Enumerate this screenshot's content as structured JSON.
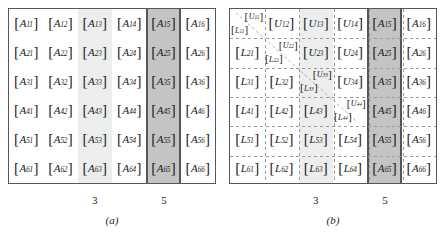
{
  "figure": {
    "rows": 6,
    "cols": 6,
    "colors": {
      "frame_border": "#55565a",
      "shade_light": "#eceded",
      "shade_dark": "#c3c4c4",
      "dash_line": "#9a9b9e",
      "text": "#1b1b1d",
      "background": "#ffffff"
    }
  },
  "panels": [
    {
      "id": "panel-a",
      "caption": "(a)",
      "column_labels": [
        {
          "text": "3",
          "column": 3
        },
        {
          "text": "5",
          "column": 5
        }
      ],
      "shaded_columns": [
        {
          "column": 3,
          "shade": "light"
        },
        {
          "column": 5,
          "shade": "dark"
        }
      ],
      "grid": [
        [
          {
            "kind": "single",
            "symbol": "A",
            "sub": "11"
          },
          {
            "kind": "single",
            "symbol": "A",
            "sub": "12"
          },
          {
            "kind": "single",
            "symbol": "A",
            "sub": "13"
          },
          {
            "kind": "single",
            "symbol": "A",
            "sub": "14"
          },
          {
            "kind": "single",
            "symbol": "A",
            "sub": "15"
          },
          {
            "kind": "single",
            "symbol": "A",
            "sub": "16"
          }
        ],
        [
          {
            "kind": "single",
            "symbol": "A",
            "sub": "21"
          },
          {
            "kind": "single",
            "symbol": "A",
            "sub": "22"
          },
          {
            "kind": "single",
            "symbol": "A",
            "sub": "23"
          },
          {
            "kind": "single",
            "symbol": "A",
            "sub": "24"
          },
          {
            "kind": "single",
            "symbol": "A",
            "sub": "25"
          },
          {
            "kind": "single",
            "symbol": "A",
            "sub": "26"
          }
        ],
        [
          {
            "kind": "single",
            "symbol": "A",
            "sub": "31"
          },
          {
            "kind": "single",
            "symbol": "A",
            "sub": "32"
          },
          {
            "kind": "single",
            "symbol": "A",
            "sub": "33"
          },
          {
            "kind": "single",
            "symbol": "A",
            "sub": "34"
          },
          {
            "kind": "single",
            "symbol": "A",
            "sub": "35"
          },
          {
            "kind": "single",
            "symbol": "A",
            "sub": "36"
          }
        ],
        [
          {
            "kind": "single",
            "symbol": "A",
            "sub": "41"
          },
          {
            "kind": "single",
            "symbol": "A",
            "sub": "42"
          },
          {
            "kind": "single",
            "symbol": "A",
            "sub": "43"
          },
          {
            "kind": "single",
            "symbol": "A",
            "sub": "44"
          },
          {
            "kind": "single",
            "symbol": "A",
            "sub": "45"
          },
          {
            "kind": "single",
            "symbol": "A",
            "sub": "46"
          }
        ],
        [
          {
            "kind": "single",
            "symbol": "A",
            "sub": "51"
          },
          {
            "kind": "single",
            "symbol": "A",
            "sub": "52"
          },
          {
            "kind": "single",
            "symbol": "A",
            "sub": "53"
          },
          {
            "kind": "single",
            "symbol": "A",
            "sub": "54"
          },
          {
            "kind": "single",
            "symbol": "A",
            "sub": "55"
          },
          {
            "kind": "single",
            "symbol": "A",
            "sub": "56"
          }
        ],
        [
          {
            "kind": "single",
            "symbol": "A",
            "sub": "61"
          },
          {
            "kind": "single",
            "symbol": "A",
            "sub": "62"
          },
          {
            "kind": "single",
            "symbol": "A",
            "sub": "63"
          },
          {
            "kind": "single",
            "symbol": "A",
            "sub": "64"
          },
          {
            "kind": "single",
            "symbol": "A",
            "sub": "65"
          },
          {
            "kind": "single",
            "symbol": "A",
            "sub": "66"
          }
        ]
      ]
    },
    {
      "id": "panel-b",
      "caption": "(b)",
      "column_labels": [
        {
          "text": "3",
          "column": 3
        },
        {
          "text": "5",
          "column": 5
        }
      ],
      "shaded_columns": [
        {
          "column": 3,
          "shade": "light"
        },
        {
          "column": 5,
          "shade": "dark"
        }
      ],
      "grid": [
        [
          {
            "kind": "stacked",
            "upper_symbol": "U",
            "upper_sub": "11",
            "lower_symbol": "L",
            "lower_sub": "11"
          },
          {
            "kind": "single",
            "symbol": "U",
            "sub": "12"
          },
          {
            "kind": "single",
            "symbol": "U",
            "sub": "13"
          },
          {
            "kind": "single",
            "symbol": "U",
            "sub": "14"
          },
          {
            "kind": "single",
            "symbol": "A",
            "sub": "15"
          },
          {
            "kind": "single",
            "symbol": "A",
            "sub": "16"
          }
        ],
        [
          {
            "kind": "single",
            "symbol": "L",
            "sub": "21"
          },
          {
            "kind": "stacked",
            "upper_symbol": "U",
            "upper_sub": "22",
            "lower_symbol": "L",
            "lower_sub": "22"
          },
          {
            "kind": "single",
            "symbol": "U",
            "sub": "23"
          },
          {
            "kind": "single",
            "symbol": "U",
            "sub": "24"
          },
          {
            "kind": "single",
            "symbol": "A",
            "sub": "25"
          },
          {
            "kind": "single",
            "symbol": "A",
            "sub": "26"
          }
        ],
        [
          {
            "kind": "single",
            "symbol": "L",
            "sub": "31"
          },
          {
            "kind": "single",
            "symbol": "L",
            "sub": "32"
          },
          {
            "kind": "stacked",
            "upper_symbol": "U",
            "upper_sub": "33",
            "lower_symbol": "L",
            "lower_sub": "33"
          },
          {
            "kind": "single",
            "symbol": "U",
            "sub": "34"
          },
          {
            "kind": "single",
            "symbol": "A",
            "sub": "35"
          },
          {
            "kind": "single",
            "symbol": "A",
            "sub": "36"
          }
        ],
        [
          {
            "kind": "single",
            "symbol": "L",
            "sub": "41"
          },
          {
            "kind": "single",
            "symbol": "L",
            "sub": "42"
          },
          {
            "kind": "single",
            "symbol": "L",
            "sub": "43"
          },
          {
            "kind": "stacked",
            "upper_symbol": "U",
            "upper_sub": "44",
            "lower_symbol": "L",
            "lower_sub": "44"
          },
          {
            "kind": "single",
            "symbol": "A",
            "sub": "45"
          },
          {
            "kind": "single",
            "symbol": "A",
            "sub": "46"
          }
        ],
        [
          {
            "kind": "single",
            "symbol": "L",
            "sub": "51"
          },
          {
            "kind": "single",
            "symbol": "L",
            "sub": "52"
          },
          {
            "kind": "single",
            "symbol": "L",
            "sub": "53"
          },
          {
            "kind": "single",
            "symbol": "L",
            "sub": "54"
          },
          {
            "kind": "single",
            "symbol": "A",
            "sub": "55"
          },
          {
            "kind": "single",
            "symbol": "A",
            "sub": "56"
          }
        ],
        [
          {
            "kind": "single",
            "symbol": "L",
            "sub": "61"
          },
          {
            "kind": "single",
            "symbol": "L",
            "sub": "62"
          },
          {
            "kind": "single",
            "symbol": "L",
            "sub": "63"
          },
          {
            "kind": "single",
            "symbol": "L",
            "sub": "64"
          },
          {
            "kind": "single",
            "symbol": "A",
            "sub": "65"
          },
          {
            "kind": "single",
            "symbol": "A",
            "sub": "66"
          }
        ]
      ]
    }
  ]
}
